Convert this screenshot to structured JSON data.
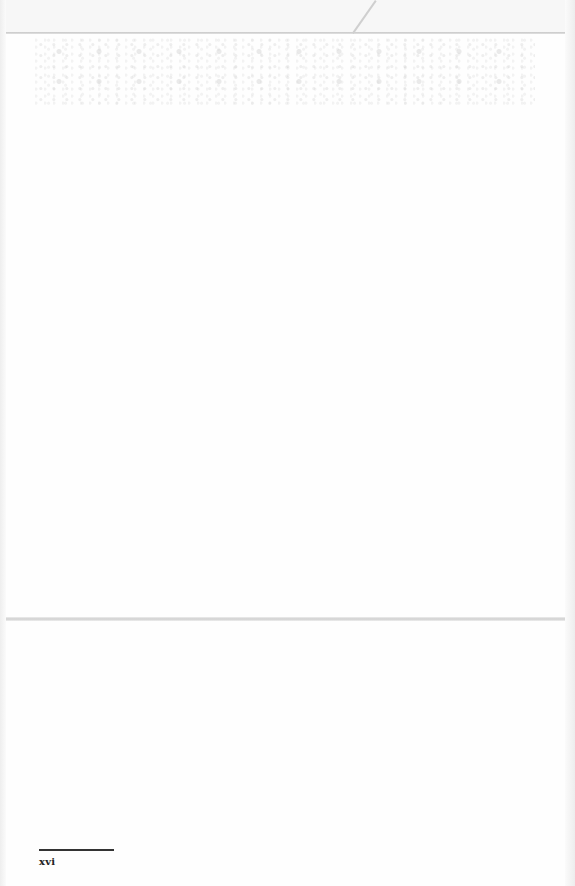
{
  "page": {
    "type": "scanned-blank-page",
    "footer": {
      "page_number": "xvi"
    }
  }
}
